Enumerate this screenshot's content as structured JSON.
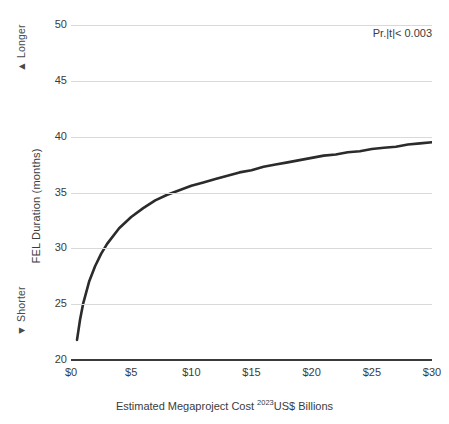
{
  "chart_data": {
    "type": "line",
    "title": "",
    "xlabel": "Estimated Megaproject Cost 2023US$ Billions",
    "xlabel_main_before": "Estimated Megaproject Cost ",
    "xlabel_superscript": "2023",
    "xlabel_main_after": "US$ Billions",
    "ylabel": "FEL Duration (months)",
    "xlim": [
      0,
      30
    ],
    "ylim": [
      20,
      50
    ],
    "grid": true,
    "legend": "none",
    "xticks": [
      0,
      5,
      10,
      15,
      20,
      25,
      30
    ],
    "xticklabels": [
      "$0",
      "$5",
      "$10",
      "$15",
      "$20",
      "$25",
      "$30"
    ],
    "yticks": [
      20,
      25,
      30,
      35,
      40,
      45,
      50
    ],
    "yticklabels": [
      "20",
      "25",
      "30",
      "35",
      "40",
      "45",
      "50"
    ],
    "series": [
      {
        "name": "FEL Duration vs Megaproject Cost",
        "color": "#2b2b2b",
        "x": [
          0.5,
          0.75,
          1,
          1.5,
          2,
          2.5,
          3,
          4,
          5,
          6,
          7,
          8,
          9,
          10,
          11,
          12,
          13,
          14,
          15,
          16,
          17,
          18,
          19,
          20,
          21,
          22,
          23,
          24,
          25,
          26,
          27,
          28,
          29,
          30
        ],
        "y": [
          21.8,
          23.6,
          25.0,
          27.0,
          28.4,
          29.5,
          30.4,
          31.8,
          32.8,
          33.6,
          34.3,
          34.8,
          35.2,
          35.6,
          35.9,
          36.2,
          36.5,
          36.8,
          37.0,
          37.3,
          37.5,
          37.7,
          37.9,
          38.1,
          38.3,
          38.4,
          38.6,
          38.7,
          38.9,
          39.0,
          39.1,
          39.3,
          39.4,
          39.5
        ]
      }
    ],
    "baseline": {
      "name": "axis-baseline",
      "value": 20,
      "color": "#3a3a3a"
    },
    "annotations": [
      {
        "name": "significance-annotation",
        "text": "Pr.|t|< 0.003",
        "position": "top-right"
      }
    ],
    "direction_labels": {
      "top": {
        "glyph": "▲",
        "text": "Longer"
      },
      "bottom": {
        "glyph": "▼",
        "text": "Shorter"
      }
    }
  },
  "axis": {
    "y_title": "FEL Duration (months)",
    "longer_text": "Longer",
    "longer_glyph": "▲",
    "shorter_text": "Shorter",
    "shorter_glyph": "▼"
  },
  "colors": {
    "curve": "#2b2b2b",
    "baseline": "#3a3a3a",
    "gridline": "#d9d9d9",
    "text": "#3b3b3b",
    "background": "#ffffff"
  }
}
